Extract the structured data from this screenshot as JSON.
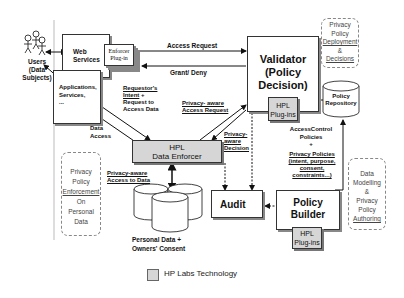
{
  "actors": {
    "users": {
      "line1": "Users",
      "line2": "(Data",
      "line3": "Subjects)"
    }
  },
  "boxes": {
    "web_services": {
      "line1": "Web",
      "line2": "Services"
    },
    "enforcer_plugin": {
      "line1": "Enforcer",
      "line2": "Plug-in"
    },
    "applications": {
      "line1": "Applications,",
      "line2": "Services,",
      "line3": "..."
    },
    "validator": {
      "line1": "Validator",
      "line2": "(Policy",
      "line3": "Decision)"
    },
    "validator_plugins": {
      "line1": "HPL",
      "line2": "Plug-ins"
    },
    "policy_repository": {
      "line1": "Policy",
      "line2": "Repository"
    },
    "data_enforcer": {
      "line1": "HPL",
      "line2": "Data Enforcer"
    },
    "audit": {
      "label": "Audit"
    },
    "policy_builder": {
      "line1": "Policy",
      "line2": "Builder"
    },
    "builder_plugins": {
      "line1": "HPL",
      "line2": "Plug-ins"
    },
    "personal_data": {
      "line1": "Personal Data +",
      "line2": "Owners' Consent"
    }
  },
  "annotations": {
    "deployment": {
      "line1": "Privacy",
      "line2": "Policy",
      "line3": "Deployment",
      "line4": "&",
      "line5": "Decisions"
    },
    "enforcement": {
      "line1": "Privacy",
      "line2": "Policy",
      "line3": "Enforcement",
      "line4": "On",
      "line5": "Personal",
      "line6": "Data"
    },
    "authoring": {
      "line1": "Data",
      "line2": "Modelling",
      "line3": "&",
      "line4": "Privacy",
      "line5": "Policy",
      "line6": "Authoring"
    }
  },
  "edge_labels": {
    "access_request": "Access Request",
    "grant_deny": "Grant/ Deny",
    "requestor_intent": {
      "line1": "Requestor's",
      "line2": "Intent",
      "line2_suffix": " +",
      "line3": "Request to",
      "line4": "Access Data"
    },
    "privacy_aware_request": {
      "line1": "Privacy- aware",
      "line2": "Access Request"
    },
    "data_access": {
      "line1": "Data",
      "line2": "Access"
    },
    "privacy_aware_decision": {
      "line1": "Privacy-",
      "line2": "aware",
      "line3": "Decision"
    },
    "privacy_aware_access": {
      "line1": "Privacy-aware",
      "line2": "Access to Data"
    },
    "access_control_policies": {
      "line1": "AccessControl",
      "line2": "Policies",
      "line3": "+"
    },
    "privacy_policies": {
      "line1": "Privacy Policies",
      "line2": "(intent, purpose,",
      "line3": "consent,",
      "line4": "constraints...)"
    }
  },
  "legend": {
    "label": "HP Labs Technology",
    "swatch_color": "#d6d6d6"
  },
  "colors": {
    "hp_labs_fill": "#d6d6d6",
    "line": "#111111",
    "dashed_note": "#888888"
  }
}
